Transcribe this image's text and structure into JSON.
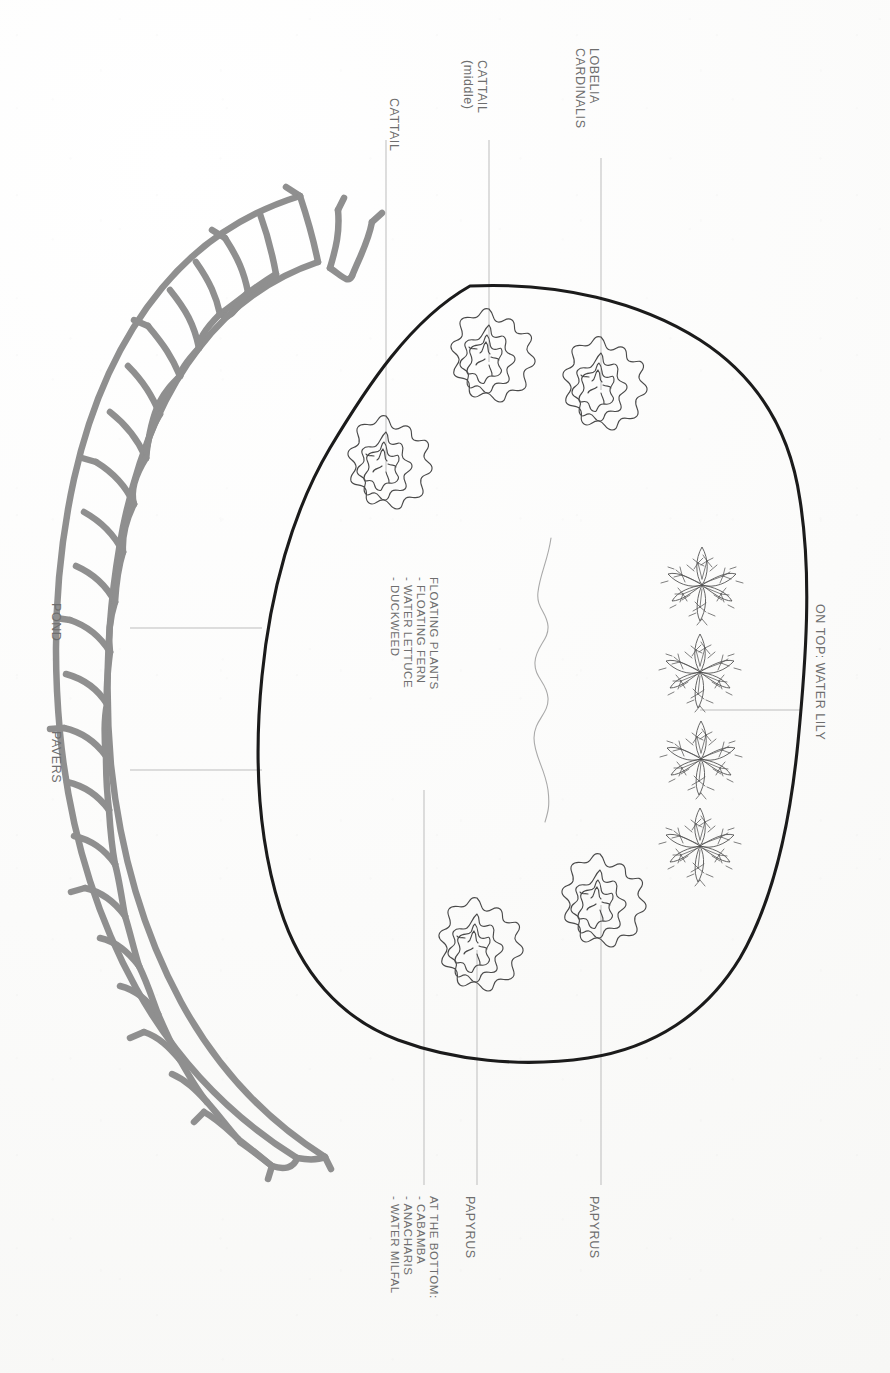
{
  "document": {
    "title": "Pond Planting Plan",
    "orientation": "landscape-rotated-90",
    "background_color": "#fdfdfc",
    "ink_color": "#5a5a5a",
    "paver_color": "#8a8a8a",
    "pond_outline_color": "#1d1d1d",
    "leader_line_color": "#b9b9b9"
  },
  "labels": {
    "cattail_outer": "CATTAIL",
    "cattail_middle": "CATTAIL\n(middle)",
    "lobelia": "LOBELIA\nCARDINALIS",
    "pond": "POND",
    "pavers": "PAVERS",
    "on_top": "ON TOP: WATER LILY",
    "papyrus_lower": "PAPYRUS",
    "papyrus_upper": "PAPYRUS",
    "floating_block": "FLOATING PLANTS\n- FLOATING FERN\n- WATER LETTUCE\n- DUCKWEED",
    "bottom_block": "AT THE BOTTOM:\n- CABAMBA\n- ANACHARIS\n- WATER MILFAL"
  },
  "lists": {
    "floating_plants": {
      "heading": "FLOATING PLANTS",
      "items": [
        "- FLOATING FERN",
        "- WATER LETTUCE",
        "- DUCKWEED"
      ]
    },
    "bottom_plants": {
      "heading": "AT THE BOTTOM:",
      "items": [
        "- CABAMBA",
        "- ANACHARIS",
        "- WATER MILFAL"
      ]
    }
  },
  "callouts": [
    {
      "name": "cattail-outer",
      "text": "CATTAIL",
      "side": "top"
    },
    {
      "name": "cattail-middle",
      "text": "CATTAIL (middle)",
      "side": "top"
    },
    {
      "name": "lobelia",
      "text": "LOBELIA CARDINALIS",
      "side": "top"
    },
    {
      "name": "pond",
      "text": "POND",
      "side": "left"
    },
    {
      "name": "pavers",
      "text": "PAVERS",
      "side": "left"
    },
    {
      "name": "water-lily",
      "text": "ON TOP: WATER LILY",
      "side": "right"
    },
    {
      "name": "papyrus-1",
      "text": "PAPYRUS",
      "side": "bottom"
    },
    {
      "name": "papyrus-2",
      "text": "PAPYRUS",
      "side": "bottom"
    },
    {
      "name": "bottom-plants",
      "text": "AT THE BOTTOM:",
      "side": "bottom"
    }
  ],
  "plant_clusters": {
    "count": 5,
    "kind": "spiky-rosette",
    "positions": [
      [
        386,
        462
      ],
      [
        489,
        355
      ],
      [
        601,
        383
      ],
      [
        477,
        944
      ],
      [
        600,
        900
      ]
    ]
  },
  "papyrus_row": {
    "count": 4,
    "kind": "palmate-rosette",
    "positions": [
      [
        700,
        580
      ],
      [
        700,
        665
      ],
      [
        700,
        750
      ],
      [
        700,
        835
      ]
    ]
  }
}
